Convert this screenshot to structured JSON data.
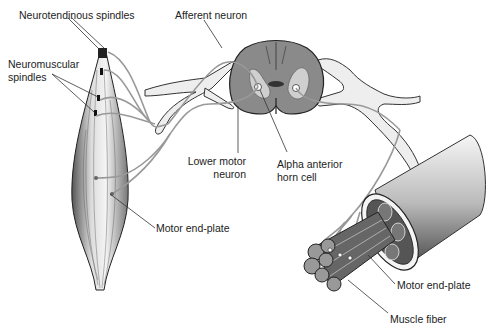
{
  "diagram": {
    "title": "",
    "labels": {
      "neurotendinous_spindles": "Neurotendinous spindles",
      "neuromuscular_spindles_l1": "Neuromuscular",
      "neuromuscular_spindles_l2": "spindles",
      "afferent_neuron": "Afferent neuron",
      "lower_motor_neuron_l1": "Lower motor",
      "lower_motor_neuron_l2": "neuron",
      "alpha_anterior_horn_cell_l1": "Alpha anterior",
      "alpha_anterior_horn_cell_l2": "horn cell",
      "motor_end_plate_left": "Motor end-plate",
      "motor_end_plate_right": "Motor end-plate",
      "muscle_fiber": "Muscle fiber"
    },
    "components": [
      "muscle",
      "spinal-cord-cross-section",
      "spinal-nerves",
      "muscle-fascicle-bundle"
    ],
    "colors": {
      "gray_matter": "#8a8a8a",
      "cord_outline": "#222222",
      "nerve_fill": "#eeeeee",
      "line": "#333333"
    }
  }
}
